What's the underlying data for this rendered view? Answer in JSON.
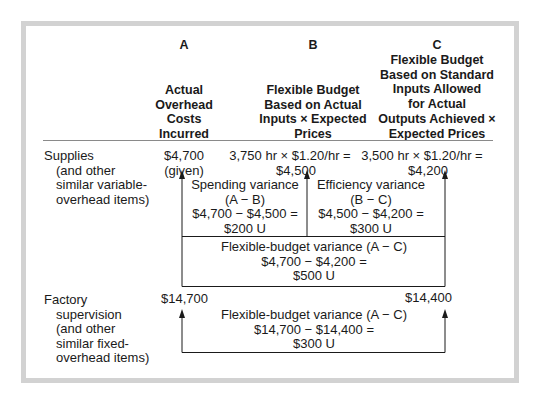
{
  "columns": {
    "a": {
      "letter": "A",
      "lines": [
        "Actual",
        "Overhead",
        "Costs",
        "Incurred"
      ]
    },
    "b": {
      "letter": "B",
      "lines": [
        "Flexible Budget",
        "Based on Actual",
        "Inputs × Expected",
        "Prices"
      ]
    },
    "c": {
      "letter": "C",
      "lines": [
        "Flexible Budget",
        "Based on Standard",
        "Inputs Allowed",
        "for Actual",
        "Outputs Achieved ×",
        "Expected Prices"
      ]
    }
  },
  "rows": {
    "supplies": {
      "label": [
        "Supplies",
        "(and other",
        "similar variable-",
        "overhead items)"
      ],
      "a_value": "$4,700",
      "a_note": "(given)",
      "b_calc": "3,750 hr × $1.20/hr =",
      "b_value": "$4,500",
      "c_calc": "3,500 hr × $1.20/hr =",
      "c_value": "$4,200",
      "spending_variance": [
        "Spending variance",
        "(A − B)",
        "$4,700 − $4,500 =",
        "$200 U"
      ],
      "efficiency_variance": [
        "Efficiency variance",
        "(B − C)",
        "$4,500 − $4,200 =",
        "$300 U"
      ],
      "flexible_budget_variance": [
        "Flexible-budget variance (A − C)",
        "$4,700 − $4,200 =",
        "$500 U"
      ]
    },
    "factory": {
      "label": [
        "Factory",
        "supervision",
        "(and other",
        "similar fixed-",
        "overhead items)"
      ],
      "a_value": "$14,700",
      "c_value": "$14,400",
      "flexible_budget_variance": [
        "Flexible-budget variance (A − C)",
        "$14,700 − $14,400 =",
        "$300 U"
      ]
    }
  },
  "colors": {
    "frame": "#d2d2d2",
    "line": "#1a1a1a"
  }
}
